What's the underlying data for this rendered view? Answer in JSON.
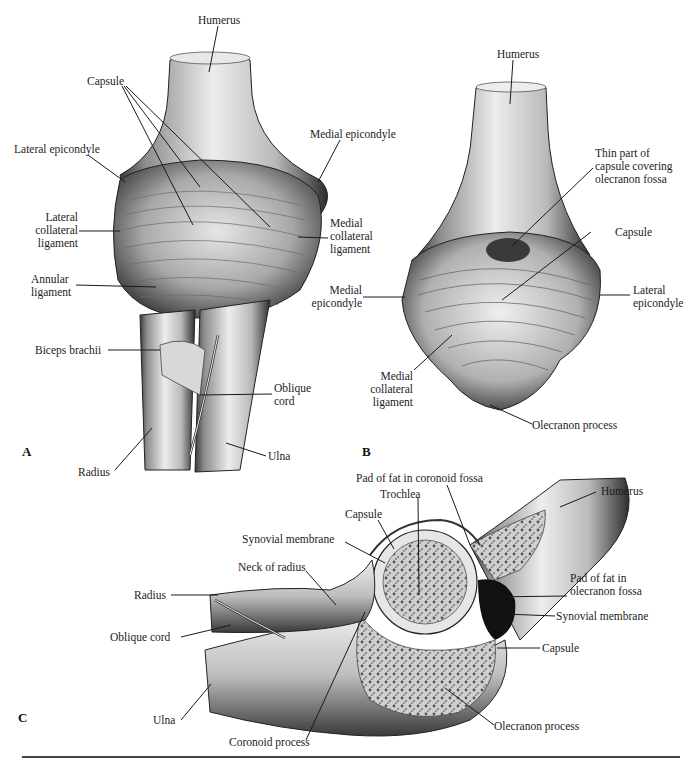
{
  "figure": {
    "panels": [
      {
        "id": "A",
        "letter": "A",
        "labels": {
          "humerus": "Humerus",
          "capsule": "Capsule",
          "lateral_epicondyle": "Lateral epicondyle",
          "medial_epicondyle": "Medial epicondyle",
          "lateral_collateral_ligament": [
            "Lateral",
            "collateral",
            "ligament"
          ],
          "medial_collateral_ligament": [
            "Medial",
            "collateral",
            "ligament"
          ],
          "annular_ligament": [
            "Annular",
            "ligament"
          ],
          "biceps_brachii": "Biceps brachii",
          "oblique_cord": [
            "Oblique",
            "cord"
          ],
          "radius": "Radius",
          "ulna": "Ulna"
        }
      },
      {
        "id": "B",
        "letter": "B",
        "labels": {
          "humerus": "Humerus",
          "thin_capsule": [
            "Thin part of",
            "capsule covering",
            "olecranon fossa"
          ],
          "capsule": "Capsule",
          "medial_epicondyle": [
            "Medial",
            "epicondyle"
          ],
          "lateral_epicondyle": [
            "Lateral",
            "epicondyle"
          ],
          "medial_collateral_ligament": [
            "Medial",
            "collateral",
            "ligament"
          ],
          "olecranon_process": "Olecranon process"
        }
      },
      {
        "id": "C",
        "letter": "C",
        "labels": {
          "pad_fat_coronoid": "Pad of fat in coronoid fossa",
          "trochlea": "Trochlea",
          "humerus": "Humerus",
          "capsule_top": "Capsule",
          "synovial_membrane_top": "Synovial membrane",
          "neck_of_radius": "Neck of radius",
          "radius": "Radius",
          "oblique_cord": "Oblique cord",
          "pad_fat_olecranon": [
            "Pad of fat in",
            "olecranon fossa"
          ],
          "synovial_membrane_right": "Synovial membrane",
          "capsule_right": "Capsule",
          "ulna": "Ulna",
          "coronoid_process": "Coronoid process",
          "olecranon_process": "Olecranon process"
        }
      }
    ]
  }
}
